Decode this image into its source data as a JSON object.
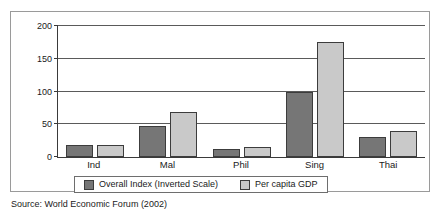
{
  "chart_data": {
    "type": "bar",
    "title": "",
    "subtitle": "",
    "xlabel": "",
    "ylabel": "",
    "ylim": [
      0,
      200
    ],
    "yticks": [
      0,
      50,
      100,
      150,
      200
    ],
    "grid": true,
    "legend_position": "bottom",
    "categories": [
      "Ind",
      "Mal",
      "Phil",
      "Sing",
      "Thai"
    ],
    "series": [
      {
        "name": "Overall Index (Inverted Scale)",
        "color": "#767676",
        "values": [
          18,
          48,
          13,
          100,
          30
        ]
      },
      {
        "name": "Per capita GDP",
        "color": "#c9c9c9",
        "values": [
          19,
          68,
          16,
          175,
          39
        ]
      }
    ]
  },
  "axis": {
    "y_tick_labels": [
      "200",
      "150",
      "100",
      "50",
      "0"
    ],
    "x_tick_labels": [
      "Ind",
      "Mal",
      "Phil",
      "Sing",
      "Thai"
    ]
  },
  "legend": {
    "items": [
      {
        "label": "Overall Index (Inverted Scale)",
        "color": "#767676"
      },
      {
        "label": "Per capita GDP",
        "color": "#c9c9c9"
      }
    ]
  },
  "caption": {
    "source": "Source: World Economic Forum (2002)"
  },
  "colors": {
    "series_dark": "#767676",
    "series_light": "#c9c9c9",
    "axis": "#3a3a3a",
    "grid": "#5a5a5a",
    "frame": "#9a9a9a"
  }
}
